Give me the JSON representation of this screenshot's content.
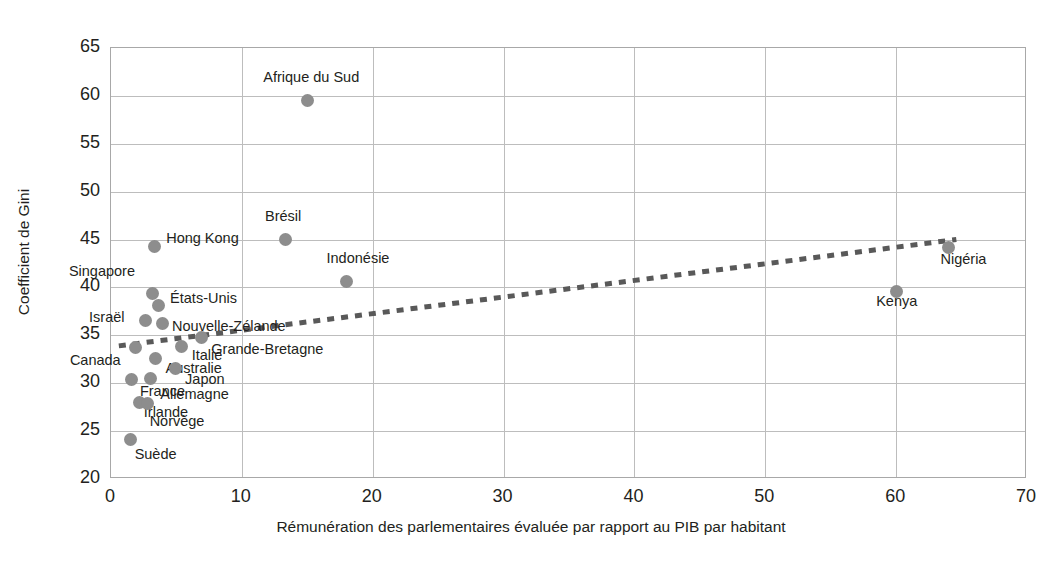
{
  "chart_data": {
    "type": "scatter",
    "title": "",
    "xlabel": "Rémunération des parlementaires évaluée par rapport au PIB par habitant",
    "ylabel": "Coefficient de Gini",
    "xlim": [
      0,
      70
    ],
    "ylim": [
      20,
      65
    ],
    "xticks": [
      "0",
      "10",
      "20",
      "30",
      "40",
      "50",
      "60",
      "70"
    ],
    "yticks": [
      "65",
      "60",
      "55",
      "50",
      "45",
      "40",
      "35",
      "30",
      "25",
      "20"
    ],
    "grid": true,
    "legend": "none",
    "marker_color": "#8d8d8d",
    "trendline": {
      "type": "dotted-linear",
      "color": "#595959",
      "x_start": 0.6,
      "y_start": 33.9,
      "x_end": 64.6,
      "y_end": 45.0
    },
    "points": [
      {
        "label": "Afrique du Sud",
        "x": 15.0,
        "y": 59.5,
        "label_dx": -44,
        "label_dy": -24
      },
      {
        "label": "Brésil",
        "x": 13.3,
        "y": 45.0,
        "label_dx": -20,
        "label_dy": -24
      },
      {
        "label": "Indonésie",
        "x": 18.0,
        "y": 40.6,
        "label_dx": -20,
        "label_dy": -24
      },
      {
        "label": "Hong Kong",
        "x": 3.3,
        "y": 44.3,
        "label_dx": 12,
        "label_dy": -8
      },
      {
        "label": "Singapore",
        "x": 3.2,
        "y": 39.4,
        "label_dx": -84,
        "label_dy": -22
      },
      {
        "label": "États-Unis",
        "x": 3.6,
        "y": 38.1,
        "label_dx": 12,
        "label_dy": -8
      },
      {
        "label": "Israël",
        "x": 2.6,
        "y": 36.5,
        "label_dx": -56,
        "label_dy": -4
      },
      {
        "label": "Nouvelle-Zélande",
        "x": 3.9,
        "y": 36.2,
        "label_dx": 10,
        "label_dy": 2
      },
      {
        "label": "Grande-Bretagne",
        "x": 6.9,
        "y": 34.8,
        "label_dx": 10,
        "label_dy": 12
      },
      {
        "label": "Canada",
        "x": 1.9,
        "y": 33.7,
        "label_dx": -66,
        "label_dy": 12
      },
      {
        "label": "Italie",
        "x": 5.4,
        "y": 33.8,
        "label_dx": 10,
        "label_dy": 8
      },
      {
        "label": "Australie",
        "x": 3.4,
        "y": 32.6,
        "label_dx": 10,
        "label_dy": 10
      },
      {
        "label": "Japon",
        "x": 4.9,
        "y": 31.5,
        "label_dx": 10,
        "label_dy": 10
      },
      {
        "label": "France",
        "x": 1.6,
        "y": 30.4,
        "label_dx": 8,
        "label_dy": 12
      },
      {
        "label": "Allemagne",
        "x": 3.0,
        "y": 30.5,
        "label_dx": 10,
        "label_dy": 16
      },
      {
        "label": "Irlande",
        "x": 2.2,
        "y": 28.0,
        "label_dx": 4,
        "label_dy": 10
      },
      {
        "label": "Norvège",
        "x": 2.8,
        "y": 27.9,
        "label_dx": 2,
        "label_dy": 18
      },
      {
        "label": "Suède",
        "x": 1.5,
        "y": 24.1,
        "label_dx": 4,
        "label_dy": 14
      },
      {
        "label": "Kenya",
        "x": 60.0,
        "y": 39.6,
        "label_dx": -20,
        "label_dy": 10
      },
      {
        "label": "Nigéria",
        "x": 64.0,
        "y": 44.2,
        "label_dx": -8,
        "label_dy": 12
      }
    ]
  }
}
